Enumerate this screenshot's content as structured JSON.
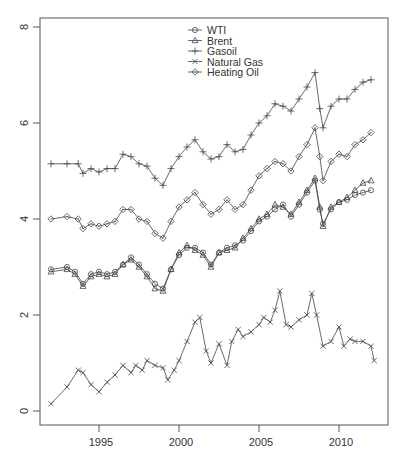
{
  "chart_data": {
    "type": "line",
    "title": "",
    "xlabel": "",
    "ylabel": "",
    "xlim": [
      1991.3,
      2012.9
    ],
    "ylim": [
      -0.3,
      8.2
    ],
    "x_ticks": [
      1995,
      2000,
      2005,
      2010
    ],
    "x_tick_labels": [
      "1995",
      "2000",
      "2005",
      "2010"
    ],
    "y_ticks": [
      0,
      2,
      4,
      6,
      8
    ],
    "y_tick_labels": [
      "0",
      "2",
      "4",
      "6",
      "8"
    ],
    "grid": false,
    "legend_position": "top-center",
    "legend": [
      "WTI",
      "Brent",
      "Gasoil",
      "Natural Gas",
      "Heating Oil"
    ],
    "series": [
      {
        "name": "WTI",
        "marker": "circle",
        "points": [
          [
            1992.0,
            2.95
          ],
          [
            1993.0,
            3.0
          ],
          [
            1993.5,
            2.9
          ],
          [
            1994.0,
            2.65
          ],
          [
            1994.5,
            2.85
          ],
          [
            1995.0,
            2.9
          ],
          [
            1995.5,
            2.85
          ],
          [
            1996.0,
            2.9
          ],
          [
            1996.5,
            3.05
          ],
          [
            1997.0,
            3.2
          ],
          [
            1997.5,
            3.05
          ],
          [
            1998.0,
            2.85
          ],
          [
            1998.5,
            2.65
          ],
          [
            1999.0,
            2.55
          ],
          [
            1999.5,
            2.95
          ],
          [
            2000.0,
            3.25
          ],
          [
            2000.5,
            3.4
          ],
          [
            2001.0,
            3.4
          ],
          [
            2001.5,
            3.3
          ],
          [
            2002.0,
            3.05
          ],
          [
            2002.5,
            3.3
          ],
          [
            2003.0,
            3.4
          ],
          [
            2003.5,
            3.45
          ],
          [
            2004.0,
            3.55
          ],
          [
            2004.5,
            3.75
          ],
          [
            2005.0,
            3.95
          ],
          [
            2005.5,
            4.05
          ],
          [
            2006.0,
            4.2
          ],
          [
            2006.5,
            4.3
          ],
          [
            2007.0,
            4.05
          ],
          [
            2007.5,
            4.3
          ],
          [
            2008.0,
            4.55
          ],
          [
            2008.5,
            4.8
          ],
          [
            2008.8,
            4.2
          ],
          [
            2009.0,
            3.9
          ],
          [
            2009.5,
            4.2
          ],
          [
            2010.0,
            4.35
          ],
          [
            2010.5,
            4.4
          ],
          [
            2011.0,
            4.5
          ],
          [
            2011.5,
            4.55
          ],
          [
            2012.0,
            4.6
          ]
        ]
      },
      {
        "name": "Brent",
        "marker": "triangle",
        "points": [
          [
            1992.0,
            2.9
          ],
          [
            1993.0,
            2.95
          ],
          [
            1993.5,
            2.85
          ],
          [
            1994.0,
            2.6
          ],
          [
            1994.5,
            2.8
          ],
          [
            1995.0,
            2.85
          ],
          [
            1995.5,
            2.8
          ],
          [
            1996.0,
            2.85
          ],
          [
            1996.5,
            3.05
          ],
          [
            1997.0,
            3.15
          ],
          [
            1997.5,
            3.0
          ],
          [
            1998.0,
            2.8
          ],
          [
            1998.5,
            2.55
          ],
          [
            1999.0,
            2.5
          ],
          [
            1999.5,
            2.95
          ],
          [
            2000.0,
            3.3
          ],
          [
            2000.5,
            3.45
          ],
          [
            2001.0,
            3.35
          ],
          [
            2001.5,
            3.25
          ],
          [
            2002.0,
            3.0
          ],
          [
            2002.5,
            3.3
          ],
          [
            2003.0,
            3.35
          ],
          [
            2003.5,
            3.4
          ],
          [
            2004.0,
            3.6
          ],
          [
            2004.5,
            3.8
          ],
          [
            2005.0,
            4.0
          ],
          [
            2005.5,
            4.1
          ],
          [
            2006.0,
            4.3
          ],
          [
            2006.5,
            4.25
          ],
          [
            2007.0,
            4.1
          ],
          [
            2007.5,
            4.35
          ],
          [
            2008.0,
            4.6
          ],
          [
            2008.5,
            4.85
          ],
          [
            2008.8,
            4.25
          ],
          [
            2009.0,
            3.85
          ],
          [
            2009.5,
            4.25
          ],
          [
            2010.0,
            4.35
          ],
          [
            2010.5,
            4.45
          ],
          [
            2011.0,
            4.6
          ],
          [
            2011.5,
            4.75
          ],
          [
            2012.0,
            4.8
          ]
        ]
      },
      {
        "name": "Gasoil",
        "marker": "plus",
        "points": [
          [
            1992.0,
            5.15
          ],
          [
            1993.0,
            5.15
          ],
          [
            1993.7,
            5.15
          ],
          [
            1994.0,
            4.95
          ],
          [
            1994.5,
            5.05
          ],
          [
            1995.0,
            4.98
          ],
          [
            1995.5,
            5.05
          ],
          [
            1996.0,
            5.05
          ],
          [
            1996.5,
            5.35
          ],
          [
            1997.0,
            5.3
          ],
          [
            1997.5,
            5.15
          ],
          [
            1998.0,
            5.1
          ],
          [
            1998.5,
            4.85
          ],
          [
            1999.0,
            4.7
          ],
          [
            1999.5,
            5.05
          ],
          [
            2000.0,
            5.3
          ],
          [
            2000.5,
            5.5
          ],
          [
            2001.0,
            5.65
          ],
          [
            2001.5,
            5.4
          ],
          [
            2002.0,
            5.25
          ],
          [
            2002.5,
            5.3
          ],
          [
            2003.0,
            5.55
          ],
          [
            2003.5,
            5.4
          ],
          [
            2004.0,
            5.45
          ],
          [
            2004.5,
            5.75
          ],
          [
            2005.0,
            6.0
          ],
          [
            2005.5,
            6.15
          ],
          [
            2006.0,
            6.4
          ],
          [
            2006.5,
            6.35
          ],
          [
            2007.0,
            6.25
          ],
          [
            2007.5,
            6.5
          ],
          [
            2008.0,
            6.75
          ],
          [
            2008.5,
            7.05
          ],
          [
            2008.8,
            6.3
          ],
          [
            2009.0,
            5.9
          ],
          [
            2009.5,
            6.35
          ],
          [
            2010.0,
            6.5
          ],
          [
            2010.5,
            6.5
          ],
          [
            2011.0,
            6.7
          ],
          [
            2011.5,
            6.85
          ],
          [
            2012.0,
            6.9
          ]
        ]
      },
      {
        "name": "Natural Gas",
        "marker": "x",
        "points": [
          [
            1992.0,
            0.15
          ],
          [
            1993.0,
            0.5
          ],
          [
            1993.7,
            0.85
          ],
          [
            1994.0,
            0.8
          ],
          [
            1994.5,
            0.55
          ],
          [
            1995.0,
            0.4
          ],
          [
            1995.5,
            0.6
          ],
          [
            1996.0,
            0.75
          ],
          [
            1996.5,
            0.95
          ],
          [
            1997.0,
            0.8
          ],
          [
            1997.3,
            0.95
          ],
          [
            1997.7,
            0.85
          ],
          [
            1998.0,
            1.05
          ],
          [
            1998.5,
            0.95
          ],
          [
            1999.0,
            0.9
          ],
          [
            1999.3,
            0.65
          ],
          [
            1999.7,
            0.85
          ],
          [
            2000.0,
            1.05
          ],
          [
            2000.5,
            1.45
          ],
          [
            2001.0,
            1.85
          ],
          [
            2001.3,
            1.95
          ],
          [
            2001.7,
            1.25
          ],
          [
            2002.0,
            1.0
          ],
          [
            2002.5,
            1.4
          ],
          [
            2003.0,
            0.95
          ],
          [
            2003.3,
            1.45
          ],
          [
            2003.7,
            1.7
          ],
          [
            2004.0,
            1.55
          ],
          [
            2004.5,
            1.65
          ],
          [
            2005.0,
            1.8
          ],
          [
            2005.3,
            1.95
          ],
          [
            2005.7,
            1.85
          ],
          [
            2006.0,
            2.1
          ],
          [
            2006.3,
            2.5
          ],
          [
            2006.7,
            1.8
          ],
          [
            2007.0,
            1.75
          ],
          [
            2007.5,
            1.9
          ],
          [
            2008.0,
            2.0
          ],
          [
            2008.3,
            2.45
          ],
          [
            2008.6,
            2.0
          ],
          [
            2009.0,
            1.35
          ],
          [
            2009.5,
            1.45
          ],
          [
            2010.0,
            1.75
          ],
          [
            2010.3,
            1.35
          ],
          [
            2010.7,
            1.5
          ],
          [
            2011.0,
            1.45
          ],
          [
            2011.5,
            1.45
          ],
          [
            2012.0,
            1.35
          ],
          [
            2012.2,
            1.05
          ]
        ]
      },
      {
        "name": "Heating Oil",
        "marker": "diamond",
        "points": [
          [
            1992.0,
            4.0
          ],
          [
            1993.0,
            4.05
          ],
          [
            1993.7,
            4.0
          ],
          [
            1994.0,
            3.8
          ],
          [
            1994.5,
            3.9
          ],
          [
            1995.0,
            3.85
          ],
          [
            1995.5,
            3.9
          ],
          [
            1996.0,
            3.95
          ],
          [
            1996.5,
            4.2
          ],
          [
            1997.0,
            4.2
          ],
          [
            1997.5,
            4.0
          ],
          [
            1998.0,
            3.95
          ],
          [
            1998.5,
            3.7
          ],
          [
            1999.0,
            3.6
          ],
          [
            1999.5,
            3.95
          ],
          [
            2000.0,
            4.25
          ],
          [
            2000.5,
            4.4
          ],
          [
            2001.0,
            4.55
          ],
          [
            2001.5,
            4.3
          ],
          [
            2002.0,
            4.1
          ],
          [
            2002.5,
            4.2
          ],
          [
            2003.0,
            4.4
          ],
          [
            2003.5,
            4.2
          ],
          [
            2004.0,
            4.3
          ],
          [
            2004.5,
            4.6
          ],
          [
            2005.0,
            4.9
          ],
          [
            2005.5,
            5.05
          ],
          [
            2006.0,
            5.2
          ],
          [
            2006.5,
            5.15
          ],
          [
            2007.0,
            5.0
          ],
          [
            2007.5,
            5.3
          ],
          [
            2008.0,
            5.55
          ],
          [
            2008.5,
            5.9
          ],
          [
            2008.8,
            5.3
          ],
          [
            2009.0,
            4.8
          ],
          [
            2009.5,
            5.2
          ],
          [
            2010.0,
            5.35
          ],
          [
            2010.5,
            5.3
          ],
          [
            2011.0,
            5.55
          ],
          [
            2011.5,
            5.65
          ],
          [
            2012.0,
            5.8
          ]
        ]
      }
    ]
  }
}
